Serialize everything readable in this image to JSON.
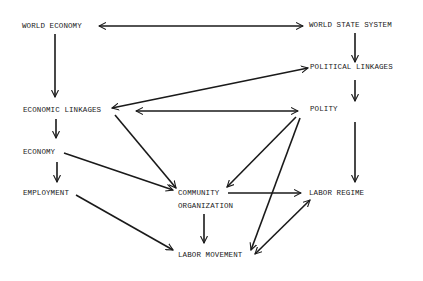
{
  "diagram": {
    "type": "flowchart",
    "nodes": {
      "world_economy": "WORLD ECONOMY",
      "world_state_system": "WORLD STATE SYSTEM",
      "political_linkages": "POLITICAL LINKAGES",
      "economic_linkages": "ECONOMIC LINKAGES",
      "polity": "POLITY",
      "economy": "ECONOMY",
      "employment": "EMPLOYMENT",
      "community_line1": "COMMUNITY",
      "community_line2": "ORGANIZATION",
      "labor_regime": "LABOR REGIME",
      "labor_movement": "LABOR MOVEMENT"
    },
    "edges": [
      {
        "from": "WORLD ECONOMY",
        "to": "WORLD STATE SYSTEM",
        "bidirectional": true
      },
      {
        "from": "WORLD ECONOMY",
        "to": "ECONOMIC LINKAGES",
        "bidirectional": false
      },
      {
        "from": "WORLD STATE SYSTEM",
        "to": "POLITICAL LINKAGES",
        "bidirectional": false
      },
      {
        "from": "POLITICAL LINKAGES",
        "to": "ECONOMIC LINKAGES",
        "bidirectional": true
      },
      {
        "from": "POLITICAL LINKAGES",
        "to": "POLITY",
        "bidirectional": false
      },
      {
        "from": "ECONOMIC LINKAGES",
        "to": "POLITY",
        "bidirectional": true
      },
      {
        "from": "ECONOMIC LINKAGES",
        "to": "ECONOMY",
        "bidirectional": false
      },
      {
        "from": "ECONOMIC LINKAGES",
        "to": "COMMUNITY ORGANIZATION",
        "bidirectional": false
      },
      {
        "from": "ECONOMY",
        "to": "EMPLOYMENT",
        "bidirectional": false
      },
      {
        "from": "ECONOMY",
        "to": "COMMUNITY ORGANIZATION",
        "bidirectional": false
      },
      {
        "from": "EMPLOYMENT",
        "to": "LABOR MOVEMENT",
        "bidirectional": false
      },
      {
        "from": "POLITY",
        "to": "COMMUNITY ORGANIZATION",
        "bidirectional": false
      },
      {
        "from": "POLITY",
        "to": "LABOR MOVEMENT",
        "bidirectional": false
      },
      {
        "from": "POLITY",
        "to": "LABOR REGIME",
        "bidirectional": false
      },
      {
        "from": "COMMUNITY ORGANIZATION",
        "to": "LABOR REGIME",
        "bidirectional": false
      },
      {
        "from": "COMMUNITY ORGANIZATION",
        "to": "LABOR MOVEMENT",
        "bidirectional": false
      },
      {
        "from": "LABOR MOVEMENT",
        "to": "LABOR REGIME",
        "bidirectional": true
      }
    ],
    "colors": {
      "line": "#1a1a1a",
      "background": "#ffffff"
    }
  }
}
